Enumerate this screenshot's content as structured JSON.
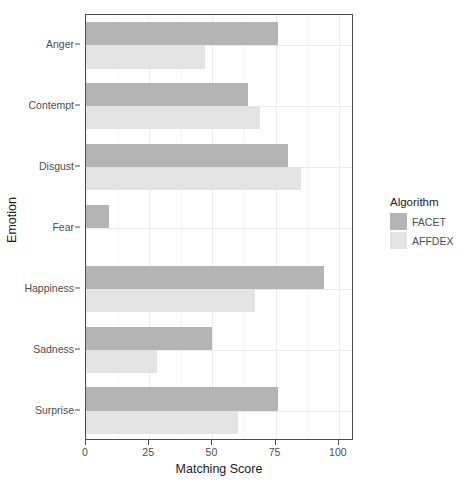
{
  "chart_data": {
    "type": "bar",
    "orientation": "horizontal",
    "title": "",
    "xlabel": "Matching Score",
    "ylabel": "Emotion",
    "categories": [
      "Anger",
      "Contempt",
      "Disgust",
      "Fear",
      "Happiness",
      "Sadness",
      "Surprise"
    ],
    "series": [
      {
        "name": "FACET",
        "color": "#b4b4b4",
        "values": [
          76,
          64,
          80,
          9,
          94,
          50,
          76
        ]
      },
      {
        "name": "AFFDEX",
        "color": "#e3e3e3",
        "values": [
          47,
          69,
          85,
          0,
          67,
          28,
          60
        ]
      }
    ],
    "xlim": [
      0,
      106
    ],
    "xticks": [
      0,
      25,
      50,
      75,
      100
    ],
    "xticklabels": [
      "0",
      "25",
      "50",
      "75",
      "100"
    ],
    "xminorticks": [
      12.5,
      37.5,
      62.5,
      87.5
    ],
    "grid": true,
    "legend": {
      "title": "Algorithm",
      "position": "right",
      "entries": [
        "FACET",
        "AFFDEX"
      ]
    }
  },
  "legend": {
    "title": "Algorithm",
    "items": [
      {
        "label": "FACET",
        "color": "#b4b4b4"
      },
      {
        "label": "AFFDEX",
        "color": "#e3e3e3"
      }
    ]
  },
  "axes": {
    "x_title": "Matching Score",
    "y_title": "Emotion"
  },
  "caption": ""
}
